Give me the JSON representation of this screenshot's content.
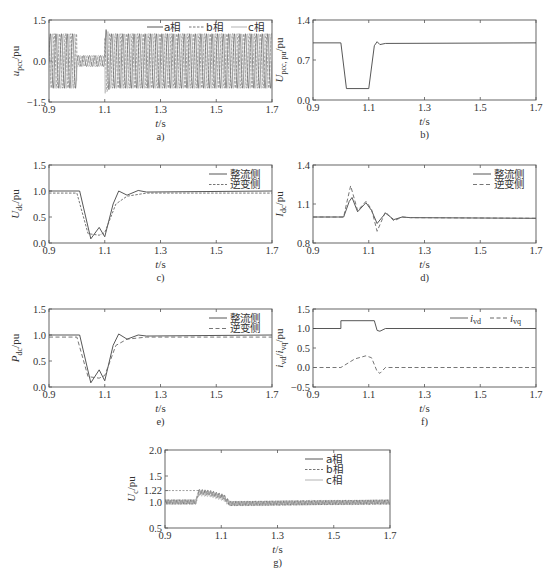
{
  "figure": {
    "panels": [
      {
        "id": "a",
        "caption": "a)",
        "ylabel": "u_pcc/pu",
        "ylabel_main": "u",
        "ylabel_sub": "pcc",
        "ylabel_unit": "/pu",
        "xlabel": "t/s",
        "yticks": [
          "1.5",
          "0.0",
          "-1.5"
        ],
        "xticks": [
          "0.9",
          "1.1",
          "1.3",
          "1.5",
          "1.7"
        ],
        "legend": [
          "a相",
          "b相",
          "c相"
        ]
      },
      {
        "id": "b",
        "caption": "b)",
        "ylabel": "U_pcc, pu/pu",
        "ylabel_main": "U",
        "ylabel_sub": "pcc, pu",
        "ylabel_unit": "/pu",
        "xlabel": "t/s",
        "yticks": [
          "1.4",
          "0.7",
          "0.0"
        ],
        "xticks": [
          "0.9",
          "1.1",
          "1.3",
          "1.5",
          "1.7"
        ],
        "legend": []
      },
      {
        "id": "c",
        "caption": "c)",
        "ylabel": "U_dc/pu",
        "ylabel_main": "U",
        "ylabel_sub": "dc",
        "ylabel_unit": "/pu",
        "xlabel": "t/s",
        "yticks": [
          "1.5",
          "1.0",
          "0.5",
          "0.0"
        ],
        "xticks": [
          "0.9",
          "1.1",
          "1.3",
          "1.5",
          "1.7"
        ],
        "legend": [
          "整流侧",
          "逆变侧"
        ]
      },
      {
        "id": "d",
        "caption": "d)",
        "ylabel": "I_dc/pu",
        "ylabel_main": "I",
        "ylabel_sub": "dc",
        "ylabel_unit": "/pu",
        "xlabel": "t/s",
        "yticks": [
          "1.4",
          "1.1",
          "0.8"
        ],
        "xticks": [
          "0.9",
          "1.1",
          "1.3",
          "1.5",
          "1.7"
        ],
        "legend": [
          "整流侧",
          "逆变侧"
        ]
      },
      {
        "id": "e",
        "caption": "e)",
        "ylabel": "P_dc/pu",
        "ylabel_main": "P",
        "ylabel_sub": "dc",
        "ylabel_unit": "/pu",
        "xlabel": "t/s",
        "yticks": [
          "1.5",
          "1.0",
          "0.5",
          "0.0"
        ],
        "xticks": [
          "0.9",
          "1.1",
          "1.3",
          "1.5",
          "1.7"
        ],
        "legend": [
          "整流侧",
          "逆变侧"
        ]
      },
      {
        "id": "f",
        "caption": "f)",
        "ylabel": "i_vd/i_vq/pu",
        "ylabel_main": "i",
        "ylabel_sub": "vd",
        "ylabel_unit": "/pu",
        "xlabel": "t/s",
        "yticks": [
          "1.5",
          "1.0",
          "0.5",
          "0.0",
          "-0.5"
        ],
        "xticks": [
          "0.9",
          "1.1",
          "1.3",
          "1.5",
          "1.7"
        ],
        "legend": [
          "i_vd",
          "i_vq"
        ],
        "legend_main": [
          "i",
          "i"
        ],
        "legend_sub": [
          "vd",
          "vq"
        ]
      },
      {
        "id": "g",
        "caption": "g)",
        "ylabel": "U_c/pu",
        "ylabel_main": "U",
        "ylabel_sub": "c",
        "ylabel_unit": "/pu",
        "xlabel": "t/s",
        "yticks": [
          "2.0",
          "1.5",
          "1.22",
          "1.0",
          "0.5"
        ],
        "xticks": [
          "0.9",
          "1.1",
          "1.3",
          "1.5",
          "1.7"
        ],
        "legend": [
          "a相",
          "b相",
          "c相"
        ]
      }
    ]
  },
  "chart_data": [
    {
      "type": "line",
      "panel": "a)",
      "title": "",
      "xlabel": "t/s",
      "ylabel": "u_pcc/pu",
      "xlim": [
        0.9,
        1.7
      ],
      "ylim": [
        -1.5,
        1.5
      ],
      "series": [
        {
          "name": "a相",
          "description": "three-phase 50Hz sinusoid, amplitude 1.0 before 1.0s, ~0.2 during fault 1.0-1.1s, overshoot ~1.2 at 1.1s then ~1.0"
        },
        {
          "name": "b相",
          "description": "same as a相 phase-shifted"
        },
        {
          "name": "c相",
          "description": "same as a相 phase-shifted"
        }
      ],
      "envelope": {
        "x": [
          0.9,
          1.0,
          1.0,
          1.1,
          1.1,
          1.12,
          1.7
        ],
        "y": [
          1.0,
          1.0,
          0.2,
          0.2,
          1.2,
          1.0,
          1.0
        ]
      }
    },
    {
      "type": "line",
      "panel": "b)",
      "xlabel": "t/s",
      "ylabel": "U_pcc, pu/pu",
      "xlim": [
        0.9,
        1.7
      ],
      "ylim": [
        0.0,
        1.4
      ],
      "series": [
        {
          "name": "U_pcc",
          "x": [
            0.9,
            1.0,
            1.02,
            1.1,
            1.12,
            1.13,
            1.14,
            1.16,
            1.7
          ],
          "y": [
            1.0,
            1.0,
            0.2,
            0.2,
            0.95,
            1.02,
            0.97,
            0.99,
            1.0
          ]
        }
      ]
    },
    {
      "type": "line",
      "panel": "c)",
      "xlabel": "t/s",
      "ylabel": "U_dc/pu",
      "xlim": [
        0.9,
        1.7
      ],
      "ylim": [
        0.0,
        1.5
      ],
      "series": [
        {
          "name": "整流侧",
          "x": [
            0.9,
            1.01,
            1.05,
            1.08,
            1.1,
            1.13,
            1.15,
            1.18,
            1.22,
            1.25,
            1.7
          ],
          "y": [
            1.0,
            1.0,
            0.08,
            0.3,
            0.12,
            0.75,
            1.0,
            0.92,
            1.01,
            0.98,
            1.0
          ]
        },
        {
          "name": "逆变侧",
          "x": [
            0.9,
            1.0,
            1.04,
            1.08,
            1.1,
            1.14,
            1.18,
            1.25,
            1.7
          ],
          "y": [
            0.96,
            0.96,
            0.18,
            0.15,
            0.2,
            0.75,
            0.9,
            0.96,
            0.96
          ]
        }
      ]
    },
    {
      "type": "line",
      "panel": "d)",
      "xlabel": "t/s",
      "ylabel": "I_dc/pu",
      "xlim": [
        0.9,
        1.7
      ],
      "ylim": [
        0.8,
        1.4
      ],
      "series": [
        {
          "name": "整流侧",
          "x": [
            0.9,
            1.01,
            1.03,
            1.04,
            1.06,
            1.09,
            1.11,
            1.13,
            1.16,
            1.19,
            1.22,
            1.25,
            1.7
          ],
          "y": [
            1.0,
            1.0,
            1.12,
            1.15,
            1.04,
            1.11,
            1.05,
            0.95,
            1.03,
            0.98,
            1.0,
            0.995,
            0.99
          ]
        },
        {
          "name": "逆变侧",
          "x": [
            0.9,
            1.01,
            1.02,
            1.035,
            1.06,
            1.09,
            1.11,
            1.13,
            1.16,
            1.19,
            1.22,
            1.25,
            1.7
          ],
          "y": [
            1.0,
            1.0,
            1.1,
            1.24,
            1.05,
            1.12,
            1.06,
            0.89,
            1.04,
            0.97,
            1.0,
            0.995,
            0.99
          ]
        }
      ]
    },
    {
      "type": "line",
      "panel": "e)",
      "xlabel": "t/s",
      "ylabel": "P_dc/pu",
      "xlim": [
        0.9,
        1.7
      ],
      "ylim": [
        0.0,
        1.5
      ],
      "series": [
        {
          "name": "整流侧",
          "x": [
            0.9,
            1.01,
            1.05,
            1.08,
            1.1,
            1.13,
            1.15,
            1.18,
            1.22,
            1.25,
            1.7
          ],
          "y": [
            1.0,
            1.0,
            0.08,
            0.33,
            0.12,
            0.8,
            1.02,
            0.92,
            1.0,
            0.98,
            1.0
          ]
        },
        {
          "name": "逆变侧",
          "x": [
            0.9,
            1.0,
            1.04,
            1.08,
            1.1,
            1.14,
            1.18,
            1.25,
            1.7
          ],
          "y": [
            0.96,
            0.96,
            0.2,
            0.17,
            0.22,
            0.8,
            0.92,
            0.96,
            0.96
          ]
        }
      ]
    },
    {
      "type": "line",
      "panel": "f)",
      "xlabel": "t/s",
      "ylabel": "i_vd/i_vq/pu",
      "xlim": [
        0.9,
        1.7
      ],
      "ylim": [
        -0.5,
        1.5
      ],
      "series": [
        {
          "name": "i_vd",
          "x": [
            0.9,
            1.0,
            1.0,
            1.12,
            1.13,
            1.14,
            1.16,
            1.7
          ],
          "y": [
            1.0,
            1.0,
            1.2,
            1.2,
            0.95,
            0.93,
            1.0,
            1.0
          ]
        },
        {
          "name": "i_vq",
          "x": [
            0.9,
            1.0,
            1.05,
            1.09,
            1.11,
            1.13,
            1.14,
            1.16,
            1.7
          ],
          "y": [
            0.0,
            0.0,
            0.22,
            0.3,
            0.25,
            -0.1,
            -0.15,
            0.0,
            0.0
          ]
        }
      ]
    },
    {
      "type": "line",
      "panel": "g)",
      "xlabel": "t/s",
      "ylabel": "U_c/pu",
      "xlim": [
        0.9,
        1.7
      ],
      "ylim": [
        0.5,
        2.0
      ],
      "annotations": [
        {
          "type": "hline",
          "y": 1.22,
          "style": "dashed",
          "x_end": 1.02
        }
      ],
      "series": [
        {
          "name": "a相",
          "description": "ripple around 1.0 (0.95-1.05) before 1.01s; rises to ~1.2 1.02-1.12s decaying to 1.1; ripple ~0.95-1.05 after 1.13s"
        },
        {
          "name": "b相",
          "description": "similar to a相 phase-shifted"
        },
        {
          "name": "c相",
          "description": "similar to a相 phase-shifted"
        }
      ],
      "envelope": {
        "x": [
          0.9,
          1.01,
          1.02,
          1.06,
          1.11,
          1.13,
          1.7
        ],
        "y": [
          1.0,
          1.0,
          1.2,
          1.18,
          1.1,
          0.97,
          1.0
        ]
      }
    }
  ]
}
